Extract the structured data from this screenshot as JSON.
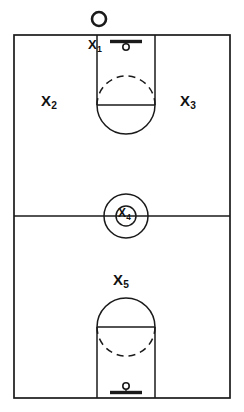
{
  "diagram": {
    "type": "basketball-court-halfcourt-diagram",
    "colors": {
      "line": "#1a1a1a",
      "background": "#ffffff",
      "label": "#111111"
    }
  },
  "court": {
    "boundary": {
      "left": 14,
      "top": 35,
      "right": 230,
      "bottom": 398,
      "stroke_width": 1.6
    },
    "midcourt_line": {
      "y": 216
    },
    "center_circle": {
      "cx": 126,
      "cy": 216,
      "outer_radius": 22,
      "inner_radius": 10
    },
    "top_key": {
      "left": 97,
      "right": 155,
      "top": 35,
      "free_throw_line_y": 105,
      "arc_radius": 29,
      "solid_arc": "bottom",
      "dashed_arc": "top"
    },
    "bottom_key": {
      "left": 97,
      "right": 155,
      "bottom": 398,
      "free_throw_line_y": 327,
      "arc_radius": 29,
      "solid_arc": "top",
      "dashed_arc": "bottom"
    },
    "top_hoop": {
      "backboard_y": 41,
      "backboard_left": 110,
      "backboard_right": 142,
      "rim_cx": 126,
      "rim_cy": 47,
      "rim_radius": 3.2
    },
    "bottom_hoop": {
      "backboard_y": 392,
      "backboard_left": 110,
      "backboard_right": 142,
      "rim_cx": 126,
      "rim_cy": 386,
      "rim_radius": 3.2
    },
    "ball": {
      "cx": 99,
      "cy": 19,
      "radius": 7,
      "stroke_width": 2.4
    }
  },
  "labels": {
    "x1": {
      "base": "X",
      "sub": "1"
    },
    "x2": {
      "base": "X",
      "sub": "2"
    },
    "x3": {
      "base": "X",
      "sub": "3"
    },
    "x4": {
      "base": "X",
      "sub": "4"
    },
    "x5": {
      "base": "X",
      "sub": "5"
    }
  }
}
